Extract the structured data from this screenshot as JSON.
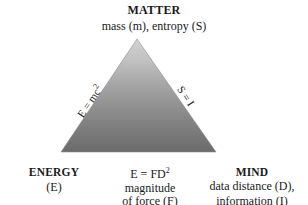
{
  "diagram": {
    "type": "triangle-concept-diagram",
    "background_color": "#ffffff",
    "text_color": "#1a1a1a",
    "triangle": {
      "fill_gradient_top": "#cfcfcf",
      "fill_gradient_bottom": "#6e6e6e",
      "apex": [
        137,
        39
      ],
      "bottom_left": [
        61,
        152
      ],
      "bottom_right": [
        216,
        152
      ]
    },
    "apex_vertex": {
      "title": "MATTER",
      "subtitle": "mass (m), entropy (S)"
    },
    "left_vertex": {
      "title": "ENERGY",
      "subtitle": "(E)"
    },
    "right_vertex": {
      "title": "MIND",
      "subtitle_line1": "data distance (D),",
      "subtitle_line2": "information (I)"
    },
    "bottom_edge": {
      "equation_base": "E = FD",
      "equation_exponent": "2",
      "line2": "magnitude",
      "line3": "of force (F)"
    },
    "left_edge": {
      "equation_base": "E = mc",
      "equation_exponent": "2"
    },
    "right_edge": {
      "equation": "S = I"
    }
  }
}
